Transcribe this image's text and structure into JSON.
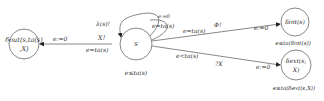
{
  "diagram": {
    "type": "state-transition",
    "colors": {
      "stroke": "#6a6a6a",
      "text": "#333333",
      "background": "#ffffff"
    },
    "nodes": [
      {
        "id": "out",
        "label_line1": "δout(s,ta(s)",
        "label_line2": ",X)",
        "below": ""
      },
      {
        "id": "s",
        "label": "s",
        "below": "e≤ta(s)"
      },
      {
        "id": "int",
        "label": "δint(s)",
        "below": "e≤ta(δint(s))"
      },
      {
        "id": "ext",
        "label_line1": "δext(s,",
        "label_line2": "X)",
        "below": "e≤ta(δext(s,X))"
      }
    ],
    "edges": [
      {
        "from": "s",
        "to": "out",
        "label_above": "X!",
        "label_below": "e=ta(s)",
        "reset": "e:=0"
      },
      {
        "from": "s",
        "to": "s",
        "label_left": "λ(s)!",
        "label_loop": "e=ta(s)",
        "label_top": "e:=0"
      },
      {
        "from": "s",
        "to": "int",
        "label_above": "e=ta(s)",
        "label_action": "Φ!",
        "reset": "e:=0"
      },
      {
        "from": "s",
        "to": "ext",
        "label_above": "e<ta(s)",
        "label_action": "?X",
        "reset": "e:=0"
      }
    ]
  }
}
